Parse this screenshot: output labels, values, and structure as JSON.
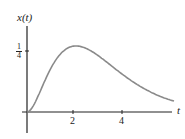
{
  "chart_data": {
    "type": "line",
    "title": "",
    "xlabel": "t",
    "ylabel": "x(t)",
    "xticks": [
      2,
      4
    ],
    "xtick_labels": [
      "2",
      "4"
    ],
    "yticks": [
      0.25
    ],
    "ytick_labels": [
      "1/4"
    ],
    "ytick_num": "1",
    "ytick_den": "4",
    "xlim": [
      0,
      6.3
    ],
    "ylim": [
      -0.1,
      0.38
    ],
    "grid": false,
    "legend": null,
    "series": [
      {
        "name": "x(t)",
        "color": "#8a8a8a",
        "x": [
          0,
          0.25,
          0.5,
          0.75,
          1.0,
          1.25,
          1.5,
          1.75,
          2.0,
          2.25,
          2.5,
          2.75,
          3.0,
          3.5,
          4.0,
          4.5,
          5.0,
          5.5,
          6.0
        ],
        "y": [
          0,
          0.024,
          0.076,
          0.133,
          0.184,
          0.224,
          0.251,
          0.266,
          0.271,
          0.267,
          0.257,
          0.242,
          0.224,
          0.185,
          0.147,
          0.112,
          0.084,
          0.062,
          0.045
        ]
      }
    ],
    "peak": {
      "t": 2,
      "x": 0.27
    }
  }
}
